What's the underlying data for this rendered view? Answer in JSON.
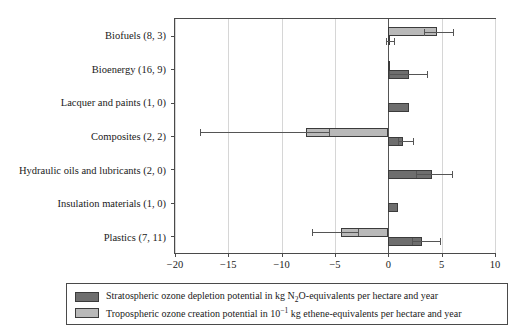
{
  "chart_data": {
    "type": "bar",
    "orientation": "horizontal",
    "title": "",
    "xlabel": "",
    "ylabel": "",
    "xlim": [
      -20,
      10
    ],
    "xticks": [
      -20,
      -15,
      -10,
      -5,
      0,
      5,
      10
    ],
    "xticklabels": [
      "−20",
      "−15",
      "−10",
      "−5",
      "0",
      "5",
      "10"
    ],
    "grid": "vertical gridlines at each x tick",
    "legend_position": "below plot",
    "categories": [
      "Biofuels (8, 3)",
      "Bioenergy (16, 9)",
      "Lacquer and paints (1, 0)",
      "Composites (2, 2)",
      "Hydraulic oils and lubricants (2, 0)",
      "Insulation materials (1, 0)",
      "Plastics (7, 11)"
    ],
    "series": [
      {
        "name": "Stratospheric ozone depletion potential in kg N2O-equivalents per hectare and year",
        "key": "stratospheric",
        "color": "#6e6e6e",
        "values": [
          0.15,
          1.9,
          1.9,
          1.4,
          4.1,
          0.9,
          3.2
        ],
        "errors_low": [
          -0.25,
          0.1,
          null,
          0.9,
          2.6,
          null,
          2.2
        ],
        "errors_high": [
          0.5,
          3.6,
          null,
          2.3,
          6.0,
          null,
          4.8
        ]
      },
      {
        "name": "Tropospheric ozone creation potential in 10^-1 kg ethene-equivalents per hectare and year",
        "key": "tropospheric",
        "color": "#b9b9b9",
        "values": [
          4.6,
          0.2,
          null,
          -7.7,
          null,
          null,
          -4.4
        ],
        "errors_low": [
          3.3,
          null,
          null,
          -17.7,
          null,
          null,
          -7.2
        ],
        "errors_high": [
          6.1,
          null,
          null,
          -5.6,
          null,
          null,
          -2.8
        ]
      }
    ]
  },
  "legend": {
    "entries": [
      {
        "swatch": "stratospheric",
        "text_before": "Stratospheric ozone depletion potential in kg N",
        "sub": "2",
        "text_after": "O-equivalents per hectare and year"
      },
      {
        "swatch": "tropospheric",
        "text_before": "Tropospheric ozone creation potential in 10",
        "sup": "−1",
        "text_after": " kg ethene-equivalents per hectare and year"
      }
    ]
  }
}
